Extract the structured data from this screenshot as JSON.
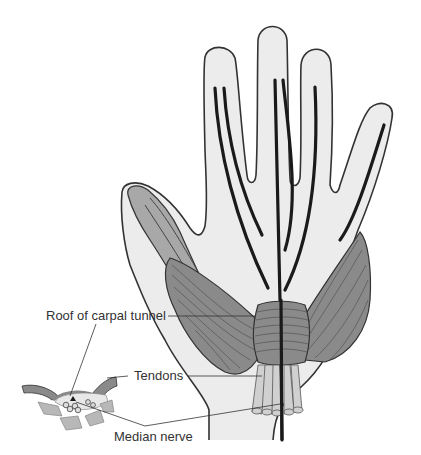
{
  "diagram": {
    "labels": {
      "roof": "Roof of carpal tunnel",
      "tendons": "Tendons",
      "median_nerve": "Median nerve"
    },
    "colors": {
      "skin": "#ececec",
      "outline": "#333333",
      "muscle": "#8a8a8a",
      "muscle_light": "#a8a8a8",
      "tendon_line": "#1a1a1a",
      "background": "#ffffff"
    }
  }
}
